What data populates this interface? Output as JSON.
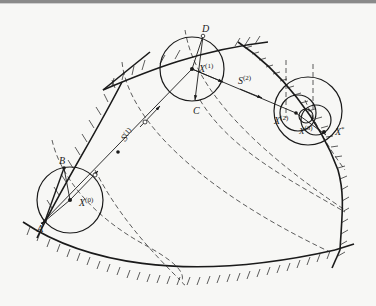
{
  "figure": {
    "colors": {
      "line": "#1a1a1a",
      "dashed": "#333333",
      "background": "#f7f7f5",
      "border": "#8a8a8a"
    }
  },
  "labels": {
    "A": "A",
    "B": "B",
    "C": "C",
    "D": "D",
    "X0": "X",
    "X0_sup": "(0)",
    "X1": "X",
    "X1_sup": "(1)",
    "X2": "X",
    "X2_sup": "(2)",
    "X3": "X",
    "X3_sup": "(3)",
    "Xstar": "X",
    "Xstar_sup": "*",
    "S1": "S",
    "S1_sup": "(1)",
    "S2": "S",
    "S2_sup": "(2)"
  },
  "points": [
    {
      "id": "X(0)",
      "x": 70,
      "y": 200
    },
    {
      "id": "X(1)",
      "x": 192,
      "y": 69
    },
    {
      "id": "X(2)",
      "x": 296,
      "y": 113
    },
    {
      "id": "X(3)",
      "x": 311,
      "y": 118
    },
    {
      "id": "X*",
      "x": 324,
      "y": 132
    },
    {
      "id": "A",
      "x": 45,
      "y": 221
    },
    {
      "id": "B",
      "x": 64,
      "y": 168
    },
    {
      "id": "C",
      "x": 196,
      "y": 100
    },
    {
      "id": "D",
      "x": 203,
      "y": 36
    }
  ],
  "search_directions": [
    {
      "id": "S(1)",
      "from": "X(0)",
      "to": "X(1)"
    },
    {
      "id": "S(2)",
      "from": "X(1)",
      "to": "X(2)"
    }
  ]
}
